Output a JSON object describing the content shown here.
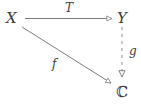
{
  "figure": {
    "kind": "commutative-diagram",
    "background_color": "#ffffff",
    "stroke_color": "#6e6e6e",
    "text_color": "#3c3c3c"
  },
  "nodes": {
    "source": "X",
    "target": "Y",
    "codomain": "ℂ"
  },
  "edges": {
    "top": {
      "label": "T",
      "style": "solid",
      "from": "X",
      "to": "Y"
    },
    "diagonal": {
      "label": "f",
      "style": "solid",
      "from": "X",
      "to": "ℂ"
    },
    "right": {
      "label": "g",
      "style": "dashed",
      "from": "Y",
      "to": "ℂ"
    }
  }
}
